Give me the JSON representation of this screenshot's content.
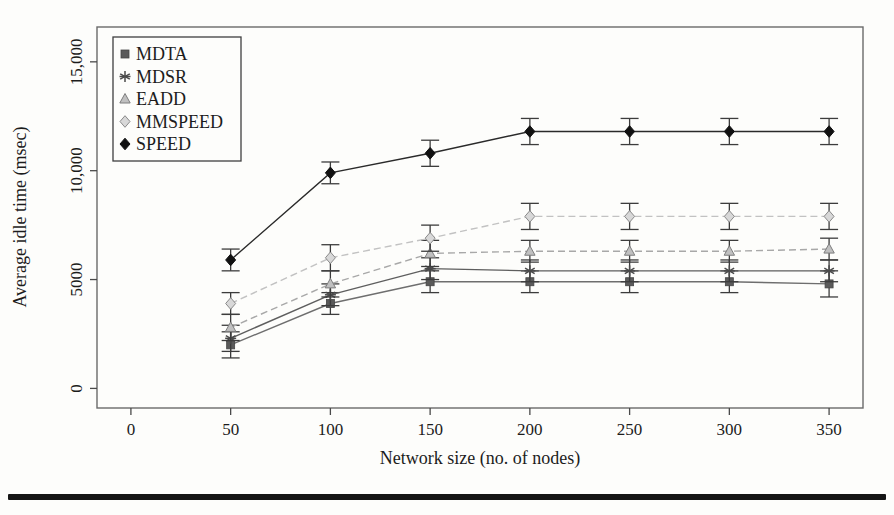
{
  "figure": {
    "background": "#fdfdfb",
    "bottom_rule_color": "#151515"
  },
  "chart_data": {
    "type": "line",
    "title": "",
    "xlabel": "Network size (no. of nodes)",
    "ylabel": "Average idle time (msec)",
    "grid": false,
    "legend_position": "top-left",
    "xlim": [
      -17,
      367
    ],
    "ylim": [
      -900,
      16600
    ],
    "xticks": [
      0,
      50,
      100,
      150,
      200,
      250,
      300,
      350
    ],
    "yticks": [
      0,
      5000,
      10000,
      15000
    ],
    "ytick_labels": [
      "0",
      "5000",
      "10,000",
      "15,000"
    ],
    "x": [
      50,
      100,
      150,
      200,
      250,
      300,
      350
    ],
    "axis_color": "#6a6a6a",
    "tick_color": "#4a4a4a",
    "error_bar_color": "#3c3c3c",
    "series": [
      {
        "name": "MDTA",
        "marker": "square",
        "marker_color": "#5a5a5a",
        "marker_stroke": "#454545",
        "line_color": "#6e6e6e",
        "line_dash": "none",
        "values": [
          2000,
          3900,
          4900,
          4900,
          4900,
          4900,
          4800
        ],
        "error": [
          600,
          500,
          500,
          500,
          500,
          500,
          600
        ]
      },
      {
        "name": "MDSR",
        "marker": "asterisk",
        "marker_color": "#4a4a4a",
        "marker_stroke": "#4a4a4a",
        "line_color": "#5e5e5e",
        "line_dash": "none",
        "values": [
          2300,
          4300,
          5500,
          5400,
          5400,
          5400,
          5400
        ],
        "error": [
          600,
          500,
          500,
          500,
          500,
          500,
          500
        ]
      },
      {
        "name": "EADD",
        "marker": "triangle",
        "marker_color": "#c0c0c0",
        "marker_stroke": "#7e7e7e",
        "line_color": "#a8a8a8",
        "line_dash": "7 4",
        "values": [
          2800,
          4800,
          6200,
          6300,
          6300,
          6300,
          6400
        ],
        "error": [
          600,
          600,
          600,
          500,
          500,
          500,
          500
        ]
      },
      {
        "name": "MMSPEED",
        "marker": "diamond-light",
        "marker_color": "#d8d8d8",
        "marker_stroke": "#8a8a8a",
        "line_color": "#c2c2c2",
        "line_dash": "7 4",
        "values": [
          3900,
          6000,
          6900,
          7900,
          7900,
          7900,
          7900
        ],
        "error": [
          500,
          600,
          600,
          600,
          600,
          600,
          600
        ]
      },
      {
        "name": "SPEED",
        "marker": "diamond",
        "marker_color": "#111111",
        "marker_stroke": "#111111",
        "line_color": "#2a2a2a",
        "line_dash": "none",
        "values": [
          5900,
          9900,
          10800,
          11800,
          11800,
          11800,
          11800
        ],
        "error": [
          500,
          500,
          600,
          600,
          600,
          600,
          600
        ]
      }
    ]
  }
}
